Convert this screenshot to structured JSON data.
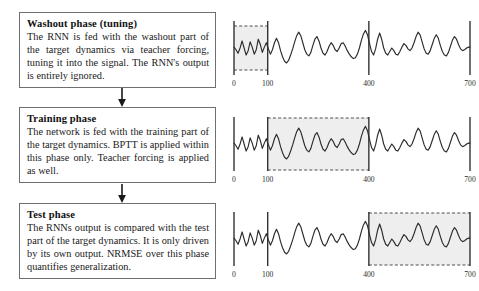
{
  "figure": {
    "colors": {
      "box_border": "#6f6f6f",
      "text": "#1a1a1a",
      "signal": "#2b2b2b",
      "shade_fill": "#eeeeee",
      "shade_dash": "#3a3a3a",
      "marker_line": "#2b2b2b"
    }
  },
  "phases": [
    {
      "id": "washout",
      "title": "Washout phase (tuning)",
      "body": "The RNN is fed with the washout part of the target dynamics via teacher forcing, tuning it into the signal. The RNN's output is entirely ignored.",
      "highlight_start": 0,
      "highlight_end": 100
    },
    {
      "id": "training",
      "title": "Training phase",
      "body": "The network is fed with the training part of the target dynamics. BPTT is applied within this phase only. Teacher forcing is applied as well.",
      "highlight_start": 100,
      "highlight_end": 400
    },
    {
      "id": "test",
      "title": "Test phase",
      "body": "The RNNs output is compared with the test part of the target dynamics. It is only driven by its own output. NRMSE over this phase quantifies generalization.",
      "highlight_start": 400,
      "highlight_end": 700
    }
  ],
  "arrows": [
    {
      "id": "washout-to-training",
      "direction": "down"
    },
    {
      "id": "training-to-test",
      "direction": "down"
    }
  ],
  "chart_data": [
    {
      "type": "line",
      "id": "washout-plot",
      "title": "",
      "xlabel": "",
      "ylabel": "",
      "xlim": [
        0,
        700
      ],
      "xticks": [
        0,
        100,
        400,
        700
      ],
      "xtick_labels": [
        "0",
        "100",
        "400",
        "700"
      ],
      "grid": false,
      "legend": "none",
      "marker_lines": [
        0,
        100,
        400,
        700
      ],
      "highlight_region": [
        0,
        100
      ],
      "highlight_style": "grey fill, dashed top and bottom, solid vertical edges",
      "x": [
        0,
        6,
        12,
        18,
        24,
        30,
        36,
        42,
        48,
        54,
        60,
        66,
        72,
        78,
        84,
        90,
        96,
        102,
        108,
        114,
        120,
        126,
        132,
        138,
        144,
        150,
        156,
        162,
        168,
        174,
        180,
        186,
        192,
        198,
        204,
        210,
        216,
        222,
        228,
        234,
        240,
        246,
        252,
        258,
        264,
        270,
        276,
        282,
        288,
        294,
        300,
        306,
        312,
        318,
        324,
        330,
        336,
        342,
        348,
        354,
        360,
        366,
        372,
        378,
        384,
        390,
        396,
        402,
        408,
        414,
        420,
        426,
        432,
        438,
        444,
        450,
        456,
        462,
        468,
        474,
        480,
        486,
        492,
        498,
        504,
        510,
        516,
        522,
        528,
        534,
        540,
        546,
        552,
        558,
        564,
        570,
        576,
        582,
        588,
        594,
        600,
        606,
        612,
        618,
        624,
        630,
        636,
        642,
        648,
        654,
        660,
        666,
        672,
        678,
        684,
        690,
        696,
        700
      ],
      "y": [
        0.52,
        0.46,
        0.38,
        0.5,
        0.66,
        0.5,
        0.34,
        0.44,
        0.64,
        0.52,
        0.36,
        0.46,
        0.7,
        0.58,
        0.4,
        0.52,
        0.62,
        0.48,
        0.36,
        0.46,
        0.62,
        0.72,
        0.62,
        0.44,
        0.3,
        0.2,
        0.16,
        0.22,
        0.34,
        0.48,
        0.64,
        0.78,
        0.86,
        0.78,
        0.62,
        0.46,
        0.36,
        0.32,
        0.4,
        0.56,
        0.7,
        0.76,
        0.66,
        0.5,
        0.38,
        0.34,
        0.42,
        0.54,
        0.62,
        0.56,
        0.46,
        0.42,
        0.5,
        0.6,
        0.62,
        0.54,
        0.44,
        0.36,
        0.3,
        0.26,
        0.28,
        0.36,
        0.5,
        0.68,
        0.82,
        0.9,
        0.8,
        0.6,
        0.42,
        0.34,
        0.48,
        0.7,
        0.84,
        0.7,
        0.5,
        0.38,
        0.34,
        0.42,
        0.5,
        0.44,
        0.36,
        0.34,
        0.42,
        0.52,
        0.6,
        0.56,
        0.48,
        0.44,
        0.5,
        0.62,
        0.76,
        0.86,
        0.8,
        0.64,
        0.48,
        0.38,
        0.36,
        0.44,
        0.58,
        0.72,
        0.8,
        0.72,
        0.56,
        0.42,
        0.34,
        0.32,
        0.4,
        0.54,
        0.68,
        0.76,
        0.7,
        0.58,
        0.48,
        0.44,
        0.46,
        0.5,
        0.52,
        0.52
      ]
    },
    {
      "type": "line",
      "id": "training-plot",
      "title": "",
      "xlabel": "",
      "ylabel": "",
      "xlim": [
        0,
        700
      ],
      "xticks": [
        0,
        100,
        400,
        700
      ],
      "xtick_labels": [
        "0",
        "100",
        "400",
        "700"
      ],
      "grid": false,
      "legend": "none",
      "marker_lines": [
        0,
        100,
        400,
        700
      ],
      "highlight_region": [
        100,
        400
      ],
      "highlight_style": "grey fill, dashed top and bottom, solid vertical edges",
      "x": [
        0,
        6,
        12,
        18,
        24,
        30,
        36,
        42,
        48,
        54,
        60,
        66,
        72,
        78,
        84,
        90,
        96,
        102,
        108,
        114,
        120,
        126,
        132,
        138,
        144,
        150,
        156,
        162,
        168,
        174,
        180,
        186,
        192,
        198,
        204,
        210,
        216,
        222,
        228,
        234,
        240,
        246,
        252,
        258,
        264,
        270,
        276,
        282,
        288,
        294,
        300,
        306,
        312,
        318,
        324,
        330,
        336,
        342,
        348,
        354,
        360,
        366,
        372,
        378,
        384,
        390,
        396,
        402,
        408,
        414,
        420,
        426,
        432,
        438,
        444,
        450,
        456,
        462,
        468,
        474,
        480,
        486,
        492,
        498,
        504,
        510,
        516,
        522,
        528,
        534,
        540,
        546,
        552,
        558,
        564,
        570,
        576,
        582,
        588,
        594,
        600,
        606,
        612,
        618,
        624,
        630,
        636,
        642,
        648,
        654,
        660,
        666,
        672,
        678,
        684,
        690,
        696,
        700
      ],
      "y": [
        0.52,
        0.46,
        0.38,
        0.5,
        0.66,
        0.5,
        0.34,
        0.44,
        0.64,
        0.52,
        0.36,
        0.46,
        0.7,
        0.58,
        0.4,
        0.52,
        0.62,
        0.48,
        0.36,
        0.46,
        0.62,
        0.72,
        0.62,
        0.44,
        0.3,
        0.2,
        0.16,
        0.22,
        0.34,
        0.48,
        0.64,
        0.78,
        0.86,
        0.78,
        0.62,
        0.46,
        0.36,
        0.32,
        0.4,
        0.56,
        0.7,
        0.76,
        0.66,
        0.5,
        0.38,
        0.34,
        0.42,
        0.54,
        0.62,
        0.56,
        0.46,
        0.42,
        0.5,
        0.6,
        0.62,
        0.54,
        0.44,
        0.36,
        0.3,
        0.26,
        0.28,
        0.36,
        0.5,
        0.68,
        0.82,
        0.9,
        0.8,
        0.6,
        0.42,
        0.34,
        0.48,
        0.7,
        0.84,
        0.7,
        0.5,
        0.38,
        0.34,
        0.42,
        0.5,
        0.44,
        0.36,
        0.34,
        0.42,
        0.52,
        0.6,
        0.56,
        0.48,
        0.44,
        0.5,
        0.62,
        0.76,
        0.86,
        0.8,
        0.64,
        0.48,
        0.38,
        0.36,
        0.44,
        0.58,
        0.72,
        0.8,
        0.72,
        0.56,
        0.42,
        0.34,
        0.32,
        0.4,
        0.54,
        0.68,
        0.76,
        0.7,
        0.58,
        0.48,
        0.44,
        0.46,
        0.5,
        0.52,
        0.52
      ]
    },
    {
      "type": "line",
      "id": "test-plot",
      "title": "",
      "xlabel": "",
      "ylabel": "",
      "xlim": [
        0,
        700
      ],
      "xticks": [
        0,
        100,
        400,
        700
      ],
      "xtick_labels": [
        "0",
        "100",
        "400",
        "700"
      ],
      "grid": false,
      "legend": "none",
      "marker_lines": [
        0,
        100,
        400,
        700
      ],
      "highlight_region": [
        400,
        700
      ],
      "highlight_style": "grey fill, dashed top and bottom, solid vertical edges",
      "x": [
        0,
        6,
        12,
        18,
        24,
        30,
        36,
        42,
        48,
        54,
        60,
        66,
        72,
        78,
        84,
        90,
        96,
        102,
        108,
        114,
        120,
        126,
        132,
        138,
        144,
        150,
        156,
        162,
        168,
        174,
        180,
        186,
        192,
        198,
        204,
        210,
        216,
        222,
        228,
        234,
        240,
        246,
        252,
        258,
        264,
        270,
        276,
        282,
        288,
        294,
        300,
        306,
        312,
        318,
        324,
        330,
        336,
        342,
        348,
        354,
        360,
        366,
        372,
        378,
        384,
        390,
        396,
        402,
        408,
        414,
        420,
        426,
        432,
        438,
        444,
        450,
        456,
        462,
        468,
        474,
        480,
        486,
        492,
        498,
        504,
        510,
        516,
        522,
        528,
        534,
        540,
        546,
        552,
        558,
        564,
        570,
        576,
        582,
        588,
        594,
        600,
        606,
        612,
        618,
        624,
        630,
        636,
        642,
        648,
        654,
        660,
        666,
        672,
        678,
        684,
        690,
        696,
        700
      ],
      "y": [
        0.52,
        0.46,
        0.38,
        0.5,
        0.66,
        0.5,
        0.34,
        0.44,
        0.64,
        0.52,
        0.36,
        0.46,
        0.7,
        0.58,
        0.4,
        0.52,
        0.62,
        0.48,
        0.36,
        0.46,
        0.62,
        0.72,
        0.62,
        0.44,
        0.3,
        0.2,
        0.16,
        0.22,
        0.34,
        0.48,
        0.64,
        0.78,
        0.86,
        0.78,
        0.62,
        0.46,
        0.36,
        0.32,
        0.4,
        0.56,
        0.7,
        0.76,
        0.66,
        0.5,
        0.38,
        0.34,
        0.42,
        0.54,
        0.62,
        0.56,
        0.46,
        0.42,
        0.5,
        0.6,
        0.62,
        0.54,
        0.44,
        0.36,
        0.3,
        0.26,
        0.28,
        0.36,
        0.5,
        0.68,
        0.82,
        0.9,
        0.8,
        0.6,
        0.42,
        0.34,
        0.48,
        0.7,
        0.84,
        0.7,
        0.5,
        0.38,
        0.34,
        0.42,
        0.5,
        0.44,
        0.36,
        0.34,
        0.42,
        0.52,
        0.6,
        0.56,
        0.48,
        0.44,
        0.5,
        0.62,
        0.76,
        0.86,
        0.8,
        0.64,
        0.48,
        0.38,
        0.36,
        0.44,
        0.58,
        0.72,
        0.8,
        0.72,
        0.56,
        0.42,
        0.34,
        0.32,
        0.4,
        0.54,
        0.68,
        0.76,
        0.7,
        0.58,
        0.48,
        0.44,
        0.46,
        0.5,
        0.52,
        0.52
      ]
    }
  ]
}
